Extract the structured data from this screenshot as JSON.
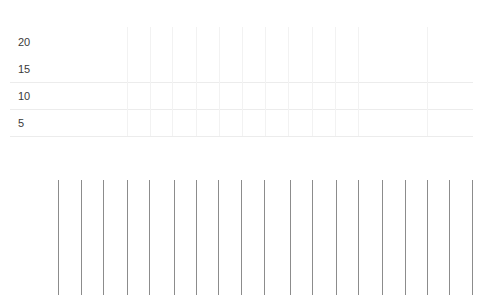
{
  "chart_data": {
    "type": "bar",
    "title": "",
    "xlabel": "",
    "ylabel": "",
    "y_ticks": [
      "20",
      "15",
      "10",
      "5"
    ],
    "ylim": [
      0,
      20
    ],
    "grid": true,
    "legend": null,
    "categories": [],
    "values": [],
    "note": "Empty chart skeleton: y-axis tick labels with light gridlines; lower region shows 19 thin gray vertical strokes of equal height"
  },
  "axis": {
    "ticks": [
      {
        "label": "20",
        "top": 36
      },
      {
        "label": "15",
        "top": 63
      },
      {
        "label": "10",
        "top": 90
      },
      {
        "label": "5",
        "top": 117
      }
    ]
  },
  "grid": {
    "h_lines": [
      82,
      109,
      136
    ],
    "v_lines": [
      127,
      150,
      172,
      196,
      219,
      242,
      265,
      288,
      312,
      335,
      358,
      427
    ]
  },
  "strokes": {
    "x_positions": [
      58,
      81,
      103,
      127,
      149,
      174,
      196,
      218,
      241,
      264,
      290,
      312,
      336,
      358,
      382,
      405,
      427,
      449,
      472
    ]
  }
}
